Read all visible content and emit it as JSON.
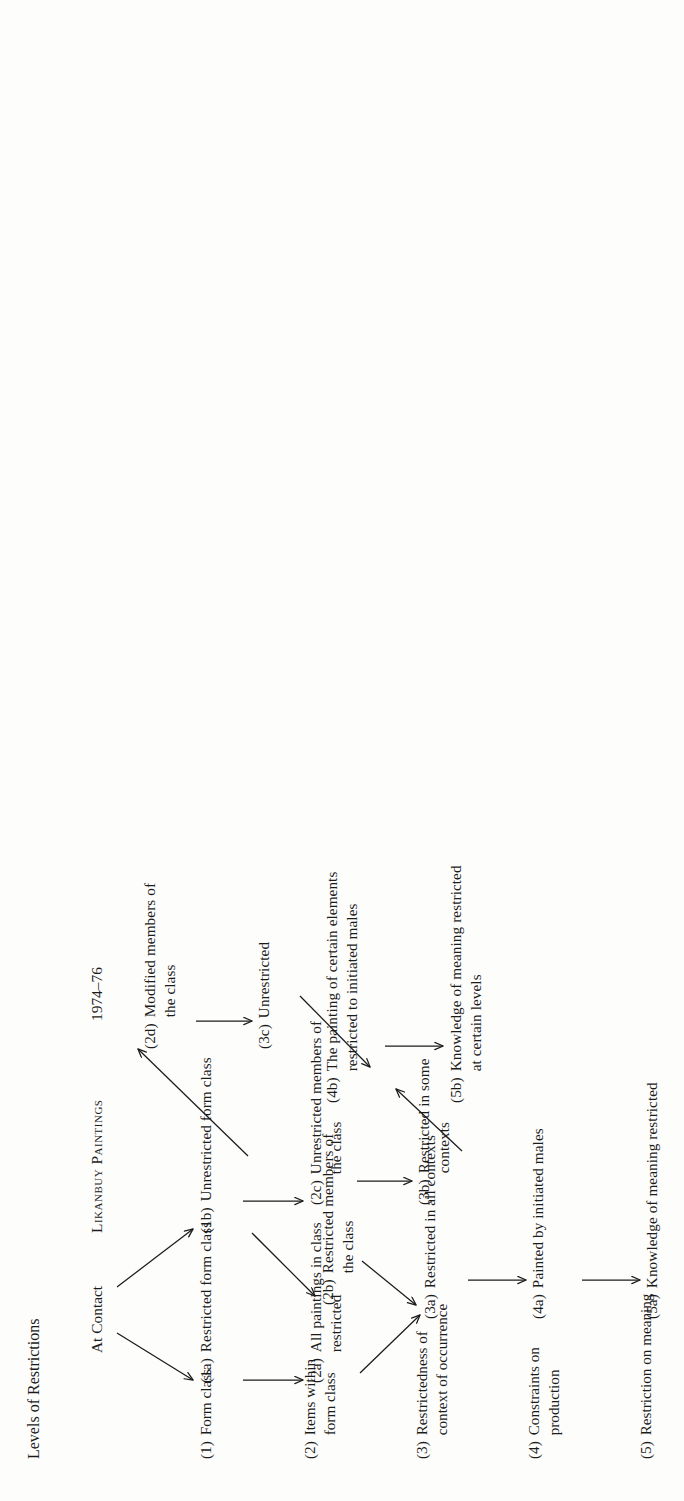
{
  "figure": {
    "row_header_title": "Levels of Restrictions",
    "column_headers": [
      {
        "id": "at-contact",
        "label": "At Contact",
        "smallcaps": false
      },
      {
        "id": "likanbuy-paintings",
        "label": "Likanbuy Paintings",
        "smallcaps": true
      },
      {
        "id": "1974-76",
        "label": "1974–76",
        "smallcaps": false
      }
    ],
    "row_labels": [
      {
        "id": "level-1",
        "tag": "(1)",
        "text": "Form class"
      },
      {
        "id": "level-2",
        "tag": "(2)",
        "text": "Items within\nform class"
      },
      {
        "id": "level-3",
        "tag": "(3)",
        "text": "Restrictedness of\ncontext of occurrence"
      },
      {
        "id": "level-4",
        "tag": "(4)",
        "text": "Constraints on\nproduction"
      },
      {
        "id": "level-5",
        "tag": "(5)",
        "text": "Restriction on meaning"
      }
    ],
    "nodes": [
      {
        "id": "1a",
        "tag": "(1a)",
        "text": "Restricted form class"
      },
      {
        "id": "1b",
        "tag": "(1b)",
        "text": "Unrestricted form class"
      },
      {
        "id": "2a",
        "tag": "(2a)",
        "text": "All paintings in class\nrestricted"
      },
      {
        "id": "2b",
        "tag": "(2b)",
        "text": "Restricted members of\nthe class"
      },
      {
        "id": "2c",
        "tag": "(2c)",
        "text": "Unrestricted members of\nthe class"
      },
      {
        "id": "2d",
        "tag": "(2d)",
        "text": "Modified members of\nthe class"
      },
      {
        "id": "3a",
        "tag": "(3a)",
        "text": "Restricted in all contexts"
      },
      {
        "id": "3b",
        "tag": "(3b)",
        "text": "Restricted in some\ncontexts"
      },
      {
        "id": "3c",
        "tag": "(3c)",
        "text": "Unrestricted"
      },
      {
        "id": "4a",
        "tag": "(4a)",
        "text": "Painted by initiated males"
      },
      {
        "id": "4b",
        "tag": "(4b)",
        "text": "The painting of certain elements\nrestricted to initiated males"
      },
      {
        "id": "5a",
        "tag": "(5a)",
        "text": "Knowledge of meaning restricted"
      },
      {
        "id": "5b",
        "tag": "(5b)",
        "text": "Knowledge of meaning restricted\nat certain levels"
      }
    ],
    "edges": [
      {
        "from": "likanbuy-paintings",
        "to": "1a",
        "style": "diagonal-arrow"
      },
      {
        "from": "likanbuy-paintings",
        "to": "1b",
        "style": "diagonal-arrow"
      },
      {
        "from": "1a",
        "to": "2a",
        "style": "horizontal-arrow"
      },
      {
        "from": "1b",
        "to": "2c",
        "style": "horizontal-arrow"
      },
      {
        "from": "1b",
        "to": "2b",
        "style": "diagonal-arrow"
      },
      {
        "from": "1b",
        "to": "2d",
        "style": "diagonal-arrow"
      },
      {
        "from": "2a",
        "to": "3a",
        "style": "diagonal-arrow"
      },
      {
        "from": "2b",
        "to": "3a",
        "style": "diagonal-arrow"
      },
      {
        "from": "2c",
        "to": "3b",
        "style": "horizontal-arrow"
      },
      {
        "from": "2d",
        "to": "3c",
        "style": "horizontal-arrow"
      },
      {
        "from": "3a",
        "to": "4a",
        "style": "horizontal-arrow"
      },
      {
        "from": "3b",
        "to": "4b",
        "style": "diagonal-arrow"
      },
      {
        "from": "3c",
        "to": "4b",
        "style": "diagonal-arrow"
      },
      {
        "from": "4a",
        "to": "5a",
        "style": "horizontal-arrow"
      },
      {
        "from": "4b",
        "to": "5b",
        "style": "horizontal-arrow"
      }
    ],
    "colors": {
      "ink": "#1b1b1b",
      "paper": "#fdfdfb"
    }
  }
}
